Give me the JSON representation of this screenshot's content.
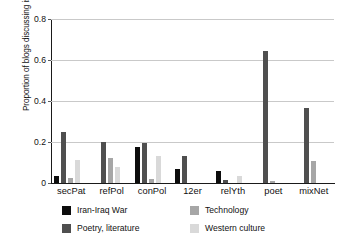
{
  "chart_data": {
    "type": "bar",
    "title": "",
    "xlabel": "",
    "ylabel": "Proportion of blogs discussing issue",
    "ylim": [
      0,
      0.8
    ],
    "y_ticks": [
      "0",
      "0.2",
      "0.4",
      "0.6",
      "0.8"
    ],
    "y_tick_values": [
      0,
      0.2,
      0.4,
      0.6,
      0.8
    ],
    "grid": "horizontal",
    "legend_position": "below-plot",
    "categories": [
      "secPat",
      "refPol",
      "conPol",
      "12er",
      "relYth",
      "poet",
      "mixNet"
    ],
    "series": [
      {
        "name": "Iran-Iraq War",
        "color": "#0d0d0d",
        "values": [
          0.033,
          0.0,
          0.177,
          0.066,
          0.061,
          0.0,
          0.0
        ]
      },
      {
        "name": "Poetry, literature",
        "color": "#4f4f4f",
        "values": [
          0.247,
          0.199,
          0.195,
          0.134,
          0.013,
          0.645,
          0.365
        ]
      },
      {
        "name": "Technology",
        "color": "#a6a6a6",
        "values": [
          0.026,
          0.121,
          0.018,
          0.0,
          0.0,
          0.01,
          0.105
        ]
      },
      {
        "name": "Western culture",
        "color": "#d9d9d9",
        "values": [
          0.11,
          0.077,
          0.134,
          0.0,
          0.034,
          0.0,
          0.0
        ]
      }
    ]
  }
}
